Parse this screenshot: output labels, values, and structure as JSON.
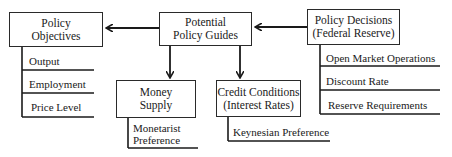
{
  "diagram": {
    "nodes": {
      "policy_objectives": {
        "line1": "Policy",
        "line2": "Objectives"
      },
      "potential_policy_guides": {
        "line1": "Potential",
        "line2": "Policy Guides"
      },
      "policy_decisions": {
        "line1": "Policy Decisions",
        "line2": "(Federal Reserve)"
      },
      "money_supply": {
        "line1": "Money",
        "line2": "Supply"
      },
      "credit_conditions": {
        "line1": "Credit Conditions",
        "line2": "(Interest Rates)"
      }
    },
    "lists": {
      "objectives": [
        "Output",
        "Employment",
        "Price Level"
      ],
      "decisions": [
        "Open Market Operations",
        "Discount Rate",
        "Reserve Requirements"
      ],
      "money_supply_note": {
        "line1": "Monetarist",
        "line2": "Preference"
      },
      "credit_conditions_note": "Keynesian Preference"
    },
    "edges": [
      {
        "from": "policy_decisions",
        "to": "potential_policy_guides",
        "type": "arrow"
      },
      {
        "from": "potential_policy_guides",
        "to": "policy_objectives",
        "type": "arrow"
      },
      {
        "from": "potential_policy_guides",
        "to": "money_supply",
        "type": "arrow"
      },
      {
        "from": "potential_policy_guides",
        "to": "credit_conditions",
        "type": "arrow"
      }
    ]
  }
}
